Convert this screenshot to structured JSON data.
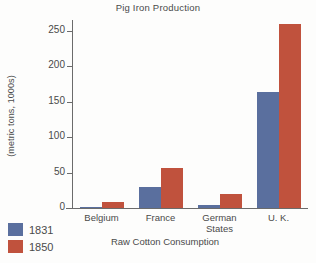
{
  "chart_data": {
    "type": "bar",
    "title": "Pig Iron Production",
    "xlabel": "Raw Cotton Consumption",
    "ylabel": "(metric tons, 1000s)",
    "categories": [
      "Belgium",
      "France",
      "German\nStates",
      "U. K."
    ],
    "category_labels": [
      "Belgium",
      "France",
      "German States",
      "U. K."
    ],
    "ylim": [
      0,
      265
    ],
    "yticks": [
      0,
      50,
      100,
      150,
      200,
      250
    ],
    "ytick_labels": [
      "0",
      "50",
      "100",
      "150",
      "200",
      "250"
    ],
    "grid": false,
    "legend_position": "bottom-left",
    "series": [
      {
        "name": "1831",
        "color": "#5a6f9e",
        "values": [
          1,
          30,
          4,
          163
        ]
      },
      {
        "name": "1850",
        "color": "#c0523d",
        "values": [
          8,
          56,
          20,
          259
        ]
      }
    ]
  },
  "legend": {
    "items": [
      {
        "label": "1831",
        "color": "#5a6f9e"
      },
      {
        "label": "1850",
        "color": "#c0523d"
      }
    ]
  }
}
